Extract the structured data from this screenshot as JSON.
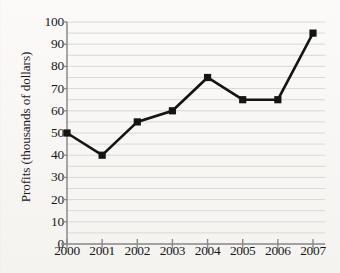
{
  "chart_data": {
    "type": "line",
    "title": "",
    "xlabel": "",
    "ylabel": "Profits (thousands of dollars)",
    "categories": [
      "2000",
      "2001",
      "2002",
      "2003",
      "2004",
      "2005",
      "2006",
      "2007"
    ],
    "values": [
      50,
      40,
      55,
      60,
      75,
      65,
      65,
      95
    ],
    "series": [
      {
        "name": "Profits",
        "values": [
          50,
          40,
          55,
          60,
          75,
          65,
          65,
          95
        ]
      }
    ],
    "ylim": [
      0,
      100
    ],
    "ytick_labels": [
      "0",
      "10",
      "20",
      "30",
      "40",
      "50",
      "60",
      "70",
      "80",
      "90",
      "100"
    ],
    "ytick_values": [
      0,
      10,
      20,
      30,
      40,
      50,
      60,
      70,
      80,
      90,
      100
    ],
    "ytick_step": 10,
    "gridline_step": 5,
    "grid": true,
    "legend": "none",
    "marker": "square",
    "line_color": "#141414",
    "marker_color": "#141414",
    "grid_color": "#d8d8d8",
    "axis_color": "#8a8a8a",
    "background_color": "#f6f5f3"
  }
}
